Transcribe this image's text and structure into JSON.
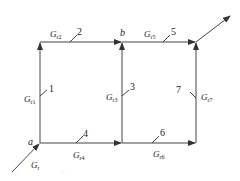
{
  "diagram": {
    "type": "signal-flow-graph",
    "nodes": [
      {
        "id": "a",
        "label": "a"
      },
      {
        "id": "b",
        "label": "b"
      }
    ],
    "branches": [
      {
        "number": "1",
        "gain": "G",
        "sub": "r1",
        "from": "a",
        "to": "top-left"
      },
      {
        "number": "2",
        "gain": "G",
        "sub": "r2",
        "from": "top-left",
        "to": "b"
      },
      {
        "number": "3",
        "gain": "G",
        "sub": "r3",
        "from": "bottom-mid",
        "to": "b"
      },
      {
        "number": "4",
        "gain": "G",
        "sub": "r4",
        "from": "a",
        "to": "bottom-mid"
      },
      {
        "number": "5",
        "gain": "G",
        "sub": "r5",
        "from": "b",
        "to": "top-right"
      },
      {
        "number": "6",
        "gain": "G",
        "sub": "r6",
        "from": "bottom-mid",
        "to": "bottom-right"
      },
      {
        "number": "7",
        "gain": "G",
        "sub": "r7",
        "from": "bottom-right",
        "to": "top-right"
      }
    ],
    "input": {
      "gain": "G",
      "sub": "r"
    },
    "caption": "···"
  }
}
